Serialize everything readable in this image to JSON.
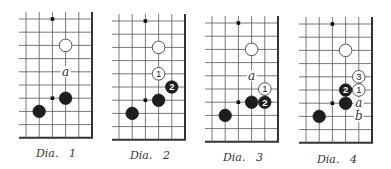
{
  "figure": {
    "background": "#ffffff",
    "line_color": "#555555",
    "black_stone_color": "#1e1e1e",
    "white_stone_color": "#ffffff",
    "spacing": 13.2,
    "stone_radius": 6.3
  },
  "diagrams": [
    {
      "caption": "Dia.   1",
      "origin": [
        26,
        19
      ],
      "caption_pos": [
        36,
        147
      ],
      "hoshi": [
        [
          2,
          0
        ],
        [
          2,
          6
        ]
      ],
      "stones": [
        {
          "color": "white",
          "col": 3,
          "row": 2,
          "label": ""
        },
        {
          "color": "black",
          "col": 3,
          "row": 6,
          "label": ""
        },
        {
          "color": "black",
          "col": 1,
          "row": 7,
          "label": ""
        }
      ],
      "marks": [
        {
          "text": "a",
          "col": 3,
          "row": 4
        }
      ]
    },
    {
      "caption": "Dia.   2",
      "origin": [
        119,
        21
      ],
      "caption_pos": [
        130,
        149
      ],
      "hoshi": [
        [
          2,
          0
        ],
        [
          2,
          6
        ]
      ],
      "stones": [
        {
          "color": "white",
          "col": 3,
          "row": 2,
          "label": ""
        },
        {
          "color": "white",
          "col": 3,
          "row": 4,
          "label": "1"
        },
        {
          "color": "black",
          "col": 4,
          "row": 5,
          "label": "2"
        },
        {
          "color": "black",
          "col": 3,
          "row": 6,
          "label": ""
        },
        {
          "color": "black",
          "col": 1,
          "row": 7,
          "label": ""
        }
      ],
      "marks": []
    },
    {
      "caption": "Dia.   3",
      "origin": [
        212,
        23
      ],
      "caption_pos": [
        223,
        151
      ],
      "hoshi": [
        [
          2,
          0
        ],
        [
          2,
          6
        ]
      ],
      "stones": [
        {
          "color": "white",
          "col": 3,
          "row": 2,
          "label": ""
        },
        {
          "color": "white",
          "col": 4,
          "row": 5,
          "label": "1"
        },
        {
          "color": "black",
          "col": 3,
          "row": 6,
          "label": ""
        },
        {
          "color": "black",
          "col": 4,
          "row": 6,
          "label": "2"
        },
        {
          "color": "black",
          "col": 1,
          "row": 7,
          "label": ""
        }
      ],
      "marks": [
        {
          "text": "a",
          "col": 3,
          "row": 4
        }
      ]
    },
    {
      "caption": "Dia.   4",
      "origin": [
        306,
        24
      ],
      "caption_pos": [
        317,
        153
      ],
      "hoshi": [
        [
          2,
          0
        ],
        [
          2,
          6
        ]
      ],
      "stones": [
        {
          "color": "white",
          "col": 3,
          "row": 2,
          "label": ""
        },
        {
          "color": "white",
          "col": 4,
          "row": 4,
          "label": "3"
        },
        {
          "color": "white",
          "col": 4,
          "row": 5,
          "label": "1"
        },
        {
          "color": "black",
          "col": 3,
          "row": 5,
          "label": "2"
        },
        {
          "color": "black",
          "col": 3,
          "row": 6,
          "label": ""
        },
        {
          "color": "black",
          "col": 1,
          "row": 7,
          "label": ""
        }
      ],
      "marks": [
        {
          "text": "a",
          "col": 4,
          "row": 6
        },
        {
          "text": "b",
          "col": 4,
          "row": 7
        }
      ]
    }
  ]
}
